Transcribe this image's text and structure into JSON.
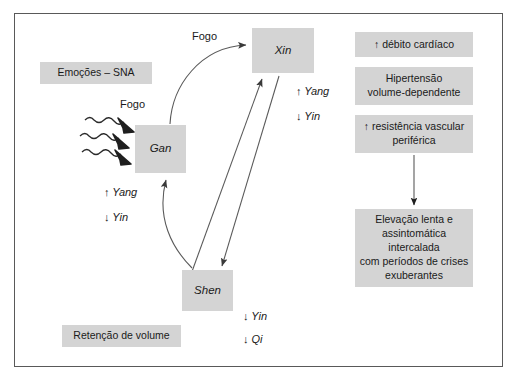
{
  "diagram": {
    "title_visible": false,
    "colors": {
      "node_fill": "#d4d4d4",
      "frame_border": "#595959",
      "text": "#1a1a1a",
      "connector": "#555555",
      "background": "#ffffff"
    },
    "nodes": {
      "xin": {
        "label": "Xin"
      },
      "gan": {
        "label": "Gan"
      },
      "shen": {
        "label": "Shen"
      },
      "emocoes": {
        "label": "Emoções – SNA"
      },
      "retencao": {
        "label": "Retenção de volume"
      },
      "debito": {
        "label": "↑ débito cardíaco"
      },
      "hipertensao": {
        "line1": "Hipertensão",
        "line2": "volume-dependente"
      },
      "resistencia": {
        "line1": "↑ resistência vascular",
        "line2": "periférica"
      },
      "elevacao": {
        "line1": "Elevação lenta e",
        "line2": "assintomática intercalada",
        "line3": "com períodos de crises",
        "line4": "exuberantes"
      }
    },
    "edge_labels": {
      "fogo_top": "Fogo",
      "fogo_mid": "Fogo",
      "yang_xin": "↑ Yang",
      "yin_xin": "↓ Yin",
      "yang_gan": "↑ Yang",
      "yin_gan": "↓ Yin",
      "yin_shen": "↓ Yin",
      "qi_shen": "↓ Qi"
    }
  }
}
